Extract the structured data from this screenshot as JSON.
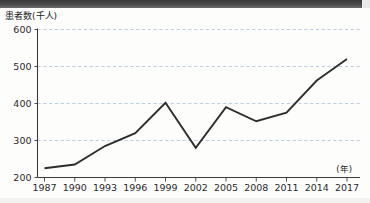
{
  "figure": {
    "y_axis_title": "患者数(千人)",
    "x_axis_unit": "(年)"
  },
  "chart_data": {
    "type": "line",
    "title": "患者数(千人)",
    "xlabel": "(年)",
    "ylabel": "患者数(千人)",
    "categories": [
      "1987",
      "1990",
      "1993",
      "1996",
      "1999",
      "2002",
      "2005",
      "2008",
      "2011",
      "2014",
      "2017"
    ],
    "values": [
      225,
      235,
      285,
      320,
      402,
      280,
      390,
      352,
      375,
      462,
      520
    ],
    "ylim": [
      200,
      600
    ],
    "yticks": [
      200,
      300,
      400,
      500,
      600
    ],
    "ytick_labels": [
      "200",
      "300",
      "400",
      "500",
      "600"
    ],
    "xtick_labels": [
      "1987",
      "1990",
      "1993",
      "1996",
      "1999",
      "2002",
      "2005",
      "2008",
      "2011",
      "2014",
      "2017"
    ],
    "grid": true,
    "grid_axis": "y",
    "legend": null,
    "legend_position": "none",
    "series": [
      {
        "name": "患者数(千人)",
        "values": [
          225,
          235,
          285,
          320,
          402,
          280,
          390,
          352,
          375,
          462,
          520
        ]
      }
    ],
    "line_color": "#2e2e2e",
    "grid_color": "#9fb6d6"
  }
}
